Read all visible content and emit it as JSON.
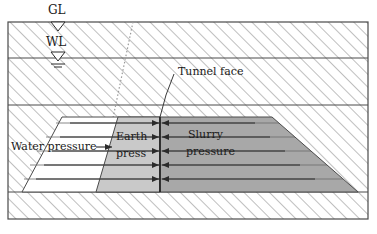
{
  "figure": {
    "type": "engineering-cross-section"
  },
  "markers": {
    "ground_level": {
      "label": "GL",
      "x": 56,
      "y": 12,
      "marker_x": 58,
      "marker_y": 22
    },
    "water_level": {
      "label": "WL",
      "x": 46,
      "y": 39,
      "marker_x": 58,
      "marker_y": 58
    }
  },
  "labels": {
    "tunnel_face": {
      "text": "Tunnel face",
      "x": 177,
      "y": 72
    },
    "water_pressure": {
      "text": "Water pressure",
      "x": 11,
      "y": 143
    },
    "earth_press_line1": {
      "text": "Earth",
      "x": 117,
      "y": 138
    },
    "earth_press_line2": {
      "text": "press",
      "x": 117,
      "y": 153
    },
    "slurry_line1": {
      "text": "Slurry",
      "x": 188,
      "y": 136
    },
    "slurry_line2": {
      "text": "pressure",
      "x": 186,
      "y": 152
    }
  },
  "geometry": {
    "frame": {
      "x": 8,
      "y": 22,
      "w": 360,
      "h": 197
    },
    "layer_lines_y": [
      58,
      105,
      192
    ],
    "tunnel_face_x": 160,
    "pressure_band_top": 117,
    "pressure_band_bottom": 192,
    "arrow_rows_y": [
      123,
      137,
      151,
      165,
      179
    ],
    "water_wedge": {
      "top_x": 62,
      "bottom_x": 22
    },
    "earth_wedge": {
      "top_x": 118,
      "bottom_x": 96
    },
    "slurry_right": {
      "top_x": 272,
      "bottom_x": 358
    },
    "failure_line": {
      "x1": 133,
      "y1": 22,
      "x2": 113,
      "y2": 118
    }
  },
  "colors": {
    "outline": "#4a4a4a",
    "hatch": "#8a8a8a",
    "earth_fill": "#c9c9c9",
    "slurry_fill": "#a8a8a8",
    "water_fill": "#ffffff",
    "text": "#1a1a1a",
    "background": "#ffffff"
  }
}
